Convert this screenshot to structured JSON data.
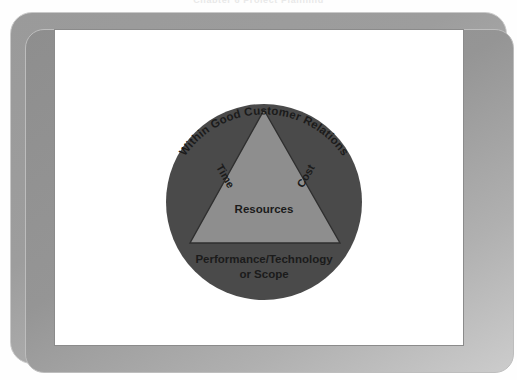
{
  "page": {
    "running_head": "Chapter 6 Project Planning"
  },
  "frame": {
    "outer_border_color": "#c9c9c9",
    "band_color": "#9a9a9a",
    "canvas_color": "#ffffff",
    "canvas_border_color": "#8b8b8b"
  },
  "diagram": {
    "name": "project-triple-constraint-triangle",
    "circle": {
      "label": "Within Good Customer Relations",
      "fill": "#4a4a4a",
      "center_x": 264,
      "center_y": 202,
      "radius": 98
    },
    "triangle": {
      "fill": "#8e8e8e",
      "stroke": "#2f2f2f",
      "apex_x": 264,
      "apex_y": 110,
      "base_y": 243,
      "base_left_x": 190,
      "base_right_x": 340
    },
    "labels": {
      "left_side": "Time",
      "right_side": "Cost",
      "center": "Resources",
      "base_line1": "Performance/Technology",
      "base_line2": "or Scope"
    }
  },
  "colors": {
    "circle_dark_gray": "#4a4a4a",
    "triangle_mid_gray": "#8e8e8e",
    "text_black": "#1b1b1b",
    "frame_gray": "#9a9a9a"
  }
}
